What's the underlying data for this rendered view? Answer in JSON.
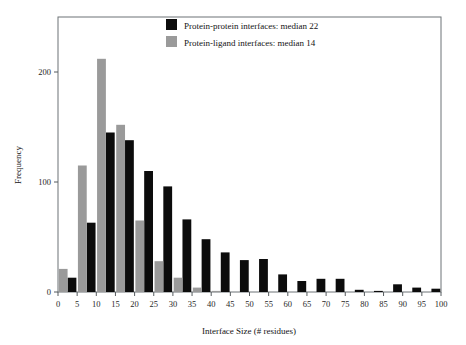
{
  "chart_data": {
    "type": "bar",
    "title": "",
    "xlabel": "Interface Size (# residues)",
    "ylabel": "Frequency",
    "xlim": [
      0,
      100
    ],
    "ylim": [
      0,
      250
    ],
    "grid": false,
    "legend_position": "top-center",
    "xticks": [
      0,
      5,
      10,
      15,
      20,
      25,
      30,
      35,
      40,
      45,
      50,
      55,
      60,
      65,
      70,
      75,
      80,
      85,
      90,
      95,
      100
    ],
    "yticks": [
      0,
      100,
      200
    ],
    "bin_starts": [
      0,
      5,
      10,
      15,
      20,
      25,
      30,
      35,
      40,
      45,
      50,
      55,
      60,
      65,
      70,
      75,
      80,
      85,
      90,
      95
    ],
    "categories": [
      "0-5",
      "5-10",
      "10-15",
      "15-20",
      "20-25",
      "25-30",
      "30-35",
      "35-40",
      "40-45",
      "45-50",
      "50-55",
      "55-60",
      "60-65",
      "65-70",
      "70-75",
      "75-80",
      "80-85",
      "85-90",
      "90-95",
      "95-100"
    ],
    "series": [
      {
        "name": "Protein-protein interfaces: median 22",
        "color": "#0c0c0c",
        "values": [
          13,
          63,
          145,
          138,
          110,
          96,
          66,
          48,
          36,
          29,
          30,
          16,
          10,
          12,
          12,
          2,
          1,
          7,
          4,
          3
        ]
      },
      {
        "name": "Protein-ligand interfaces: median 14",
        "color": "#9a9a9a",
        "values": [
          21,
          115,
          212,
          152,
          65,
          28,
          13,
          4,
          1,
          0,
          0,
          0,
          0,
          0,
          0,
          0,
          0,
          0,
          0,
          0
        ]
      }
    ]
  },
  "legend": {
    "items": [
      {
        "label": "Protein-protein interfaces: median 22",
        "swatch_color": "#0c0c0c",
        "swatch_name": "legend-swatch-protein-protein"
      },
      {
        "label": "Protein-ligand interfaces: median 14",
        "swatch_color": "#9a9a9a",
        "swatch_name": "legend-swatch-protein-ligand"
      }
    ]
  },
  "axes": {
    "x_title": "Interface Size (# residues)",
    "y_title": "Frequency"
  },
  "colors": {
    "background": "#ffffff",
    "frame": "#6d7376",
    "text": "#141414",
    "series_protein_protein": "#0c0c0c",
    "series_protein_ligand": "#9a9a9a"
  }
}
